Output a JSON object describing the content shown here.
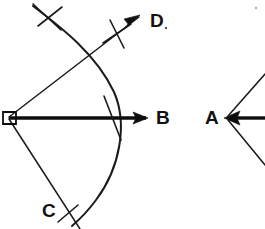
{
  "canvas": {
    "width": 265,
    "height": 229,
    "background": "#ffffff",
    "ink_color": "#111111"
  },
  "figure": {
    "left_construction": {
      "name": "angle-DBC-construction",
      "vertex": {
        "x": 8,
        "y": 118,
        "marker": "small-square"
      },
      "rays": [
        {
          "name": "ray-to-B",
          "label": "B",
          "from": [
            8,
            118
          ],
          "to": [
            148,
            118
          ],
          "style": "thick",
          "arrow": true
        },
        {
          "name": "ray-to-D",
          "label": "D",
          "from": [
            8,
            118
          ],
          "to": [
            142,
            14
          ],
          "style": "thin",
          "arrow": true
        },
        {
          "name": "ray-to-C",
          "label": "C",
          "from": [
            8,
            118
          ],
          "to": [
            78,
            229
          ],
          "style": "thin",
          "arrow": false
        }
      ],
      "arc": {
        "name": "construction-arc",
        "start": [
          33,
          8
        ],
        "control": [
          135,
          105
        ],
        "end": [
          72,
          223
        ]
      },
      "tick_marks": [
        {
          "name": "tick-top-arc",
          "x": 48,
          "y": 17
        },
        {
          "name": "tick-at-D-intersection",
          "x": 118,
          "y": 35
        },
        {
          "name": "tick-at-B-intersection",
          "x": 113,
          "y": 118
        },
        {
          "name": "tick-at-C-intersection",
          "x": 67,
          "y": 214
        }
      ]
    },
    "right_construction": {
      "name": "angle-A-construction",
      "vertex": {
        "x": 232,
        "y": 118
      },
      "rays": [
        {
          "name": "ray-A-horizontal",
          "from": [
            232,
            118
          ],
          "to": [
            265,
            118
          ],
          "style": "thick",
          "arrow": true
        },
        {
          "name": "ray-A-upper",
          "from": [
            232,
            118
          ],
          "to": [
            265,
            80
          ],
          "style": "thin",
          "arrow": false
        },
        {
          "name": "ray-A-lower",
          "from": [
            232,
            118
          ],
          "to": [
            265,
            160
          ],
          "style": "thin",
          "arrow": false
        }
      ]
    }
  },
  "labels": [
    {
      "id": "label-D",
      "text": "D",
      "x": 150,
      "y": 21,
      "trailing_dot": true
    },
    {
      "id": "label-B",
      "text": "B",
      "x": 156,
      "y": 118,
      "trailing_dot": false
    },
    {
      "id": "label-C",
      "text": "C",
      "x": 42,
      "y": 211,
      "trailing_dot": false
    },
    {
      "id": "label-A",
      "text": "A",
      "x": 205,
      "y": 118,
      "trailing_dot": false
    }
  ],
  "artifacts": [
    {
      "id": "speck-top-right",
      "x": 256,
      "y": 8,
      "r": 1.4
    }
  ]
}
